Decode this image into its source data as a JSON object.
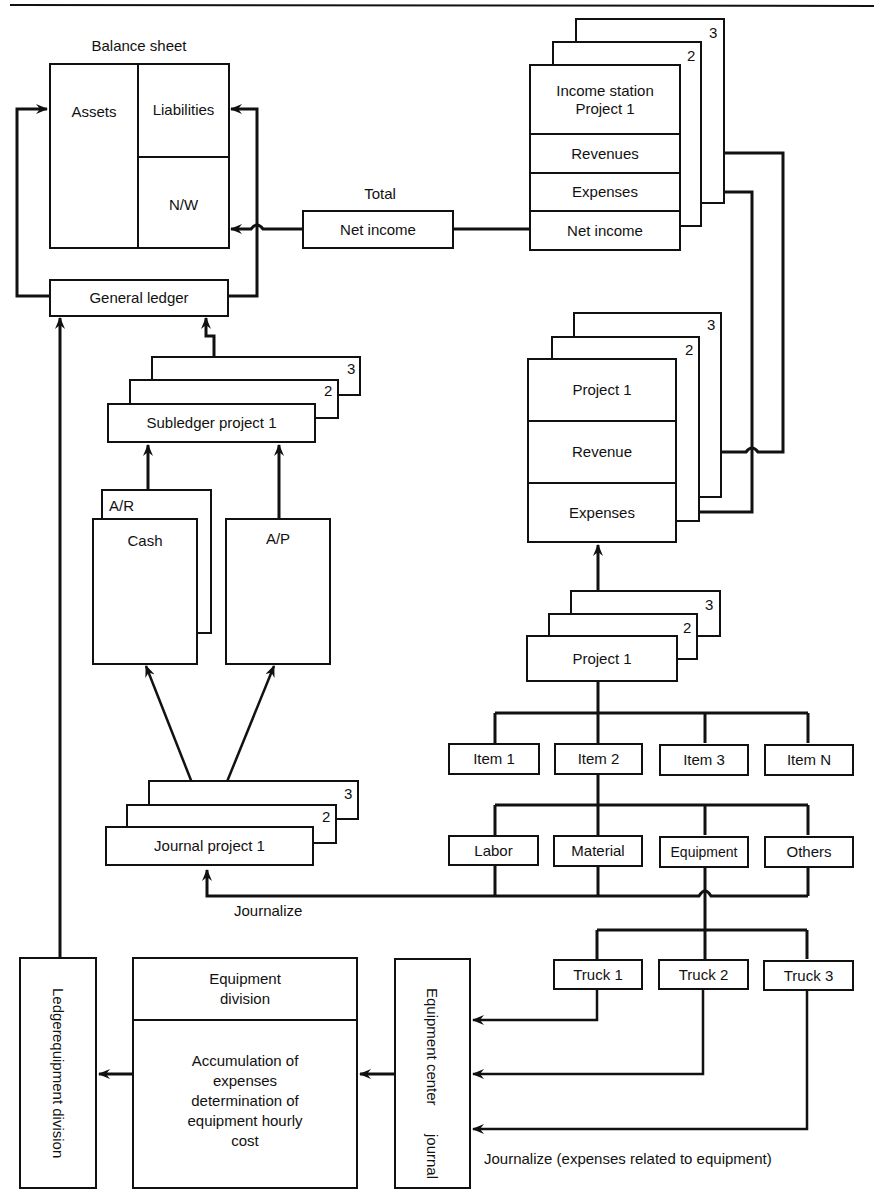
{
  "diagram": {
    "balance_sheet": {
      "title": "Balance sheet",
      "assets": "Assets",
      "liabilities": "Liabilities",
      "net_worth": "N/W"
    },
    "general_ledger": "General ledger",
    "total_label": "Total",
    "net_income_total": "Net income",
    "income_statement": {
      "title_line1": "Income station",
      "title_line2": "Project 1",
      "revenues": "Revenues",
      "expenses": "Expenses",
      "net_income": "Net income",
      "stack_numbers": [
        "2",
        "3"
      ]
    },
    "subledger": {
      "label": "Subledger project 1",
      "stack_numbers": [
        "2",
        "3"
      ]
    },
    "accounts": {
      "back": "A/R",
      "cash": "Cash",
      "payable": "A/P"
    },
    "project_statement": {
      "title": "Project 1",
      "revenue": "Revenue",
      "expenses": "Expenses",
      "stack_numbers": [
        "2",
        "3"
      ]
    },
    "project_cost": {
      "label": "Project 1",
      "stack_numbers": [
        "2",
        "3"
      ]
    },
    "items": [
      "Item 1",
      "Item 2",
      "Item 3",
      "Item N"
    ],
    "categories": [
      "Labor",
      "Material",
      "Equipment",
      "Others"
    ],
    "journal": {
      "label": "Journal project 1",
      "stack_numbers": [
        "2",
        "3"
      ]
    },
    "journalize_label": "Journalize",
    "trucks": [
      "Truck 1",
      "Truck 2",
      "Truck 3"
    ],
    "ledger_equipment": {
      "line1": "Ledger",
      "line2": "equipment division"
    },
    "equipment_division": {
      "title_line1": "Equipment",
      "title_line2": "division",
      "body_lines": [
        "Accumulation of",
        "expenses",
        "determination of",
        "equipment hourly",
        "cost"
      ]
    },
    "equipment_center_journal": {
      "line1": "Equipment center",
      "line2": "journal"
    },
    "journalize_equipment_label": "Journalize (expenses related to equipment)"
  }
}
